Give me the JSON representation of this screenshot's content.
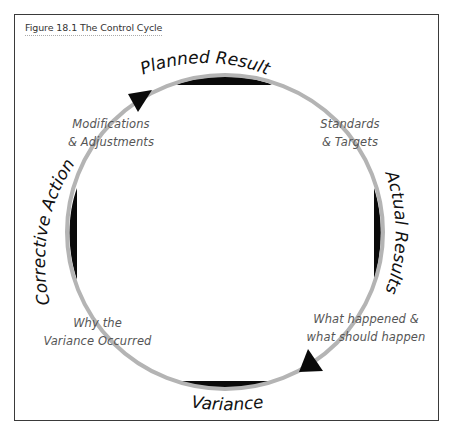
{
  "figure": {
    "caption": "Figure 18.1 The Control Cycle"
  },
  "stages": [
    {
      "id": "planned-result",
      "label": "Planned Result",
      "position": "top"
    },
    {
      "id": "actual-results",
      "label": "Actual Results",
      "position": "right"
    },
    {
      "id": "variance",
      "label": "Variance",
      "position": "bottom"
    },
    {
      "id": "corrective-action",
      "label": "Corrective Action",
      "position": "left"
    }
  ],
  "notes": {
    "top_left": [
      "Modifications",
      "& Adjustments"
    ],
    "top_right": [
      "Standards",
      "& Targets"
    ],
    "bottom_right": [
      "What happened &",
      "what should happen"
    ],
    "bottom_left": [
      "Why the",
      "Variance Occurred"
    ]
  },
  "colors": {
    "ring": "#b4b4b4",
    "crescent": "#0a0a0a",
    "arrow": "#0a0a0a",
    "text": "#111111",
    "note_text": "#555555",
    "frame": "#3a3a3a"
  }
}
